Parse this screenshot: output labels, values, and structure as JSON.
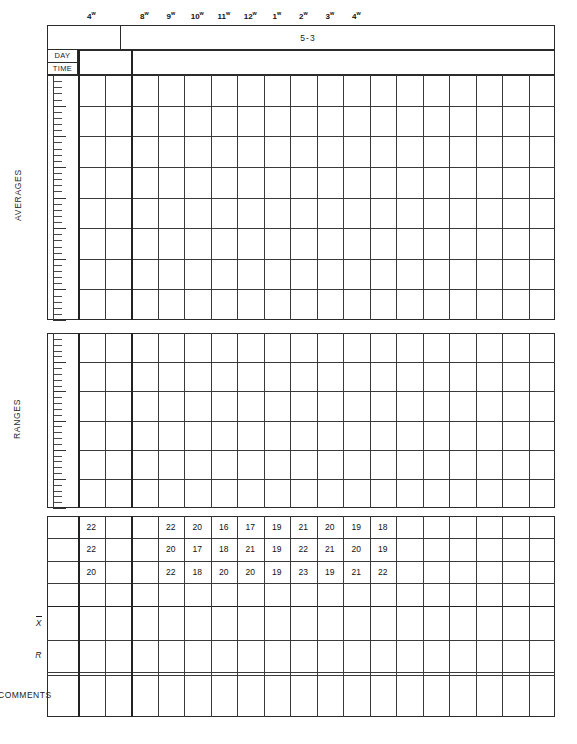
{
  "form": {
    "chart_number": "5-3",
    "day_label": "DAY",
    "time_label": "TIME",
    "averages_caption": "AVERAGES",
    "ranges_caption": "RANGES",
    "comments_label": "COMMENTS",
    "xbar_label": "X",
    "range_label": "R"
  },
  "time_header": {
    "lead": {
      "value": "4",
      "sup": "w"
    },
    "slots": [
      {
        "value": "8",
        "sup": "w"
      },
      {
        "value": "9",
        "sup": "w"
      },
      {
        "value": "10",
        "sup": "w"
      },
      {
        "value": "11",
        "sup": "w"
      },
      {
        "value": "12",
        "sup": "w"
      },
      {
        "value": "1",
        "sup": "w"
      },
      {
        "value": "2",
        "sup": "w"
      },
      {
        "value": "3",
        "sup": "w"
      },
      {
        "value": "4",
        "sup": "w"
      }
    ]
  },
  "chart_data": {
    "type": "table",
    "title": "5-3",
    "xlabel": "TIME",
    "ylabel": "",
    "grid": true,
    "legend": "none",
    "panels": [
      {
        "name": "AVERAGES",
        "plotted_points": [],
        "ylim": [
          0,
          40
        ],
        "gridlines": 8,
        "minor_ticks_per_gridline": 5
      },
      {
        "name": "RANGES",
        "plotted_points": [],
        "ylim": [
          0,
          30
        ],
        "gridlines": 6,
        "minor_ticks_per_gridline": 5
      }
    ],
    "sample_row_labels": [
      "1",
      "2",
      "3",
      "4"
    ],
    "subgroups": [
      {
        "column": 1,
        "readings": [
          "22",
          "22",
          "20"
        ]
      },
      {
        "column": 2,
        "readings": [
          "",
          "",
          ""
        ]
      },
      {
        "column": 3,
        "readings": [
          "22",
          "20",
          "22"
        ]
      },
      {
        "column": 4,
        "readings": [
          "20",
          "17",
          "18"
        ]
      },
      {
        "column": 5,
        "readings": [
          "16",
          "18",
          "20"
        ]
      },
      {
        "column": 6,
        "readings": [
          "17",
          "21",
          "20"
        ]
      },
      {
        "column": 7,
        "readings": [
          "19",
          "19",
          "19"
        ]
      },
      {
        "column": 8,
        "readings": [
          "21",
          "22",
          "23"
        ]
      },
      {
        "column": 9,
        "readings": [
          "20",
          "21",
          "19"
        ]
      },
      {
        "column": 10,
        "readings": [
          "19",
          "20",
          "21"
        ]
      },
      {
        "column": 11,
        "readings": [
          "18",
          "19",
          "22"
        ]
      },
      {
        "column": 12,
        "readings": [
          "",
          "",
          ""
        ]
      },
      {
        "column": 13,
        "readings": [
          "",
          "",
          ""
        ]
      },
      {
        "column": 14,
        "readings": [
          "",
          "",
          ""
        ]
      },
      {
        "column": 15,
        "readings": [
          "",
          "",
          ""
        ]
      },
      {
        "column": 16,
        "readings": [
          "",
          "",
          ""
        ]
      },
      {
        "column": 17,
        "readings": [
          "",
          "",
          ""
        ]
      },
      {
        "column": 18,
        "readings": [
          "",
          "",
          ""
        ]
      },
      {
        "column": 19,
        "readings": [
          "",
          "",
          ""
        ]
      },
      {
        "column": 20,
        "readings": [
          "",
          "",
          ""
        ]
      }
    ],
    "xbar_values": [
      "",
      "",
      "",
      "",
      "",
      "",
      "",
      "",
      "",
      "",
      "",
      "",
      "",
      "",
      "",
      "",
      "",
      "",
      "",
      ""
    ],
    "range_values": [
      "",
      "",
      "",
      "",
      "",
      "",
      "",
      "",
      "",
      "",
      "",
      "",
      "",
      "",
      "",
      "",
      "",
      "",
      "",
      ""
    ],
    "comments_values": [
      "",
      "",
      "",
      "",
      "",
      "",
      "",
      "",
      "",
      "",
      "",
      "",
      "",
      "",
      "",
      "",
      "",
      "",
      "",
      ""
    ]
  }
}
